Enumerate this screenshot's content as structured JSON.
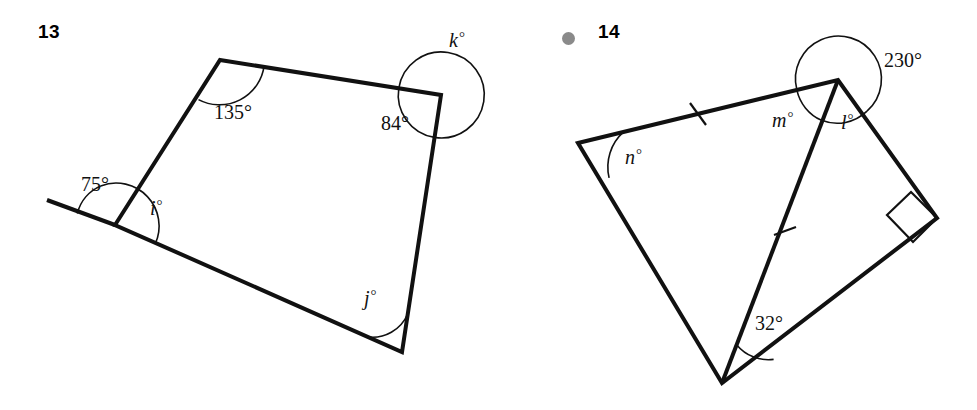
{
  "page": {
    "background": "#ffffff",
    "stroke_color": "#111111",
    "bullet_color": "#8a8a8a"
  },
  "figures": [
    {
      "id": "13",
      "number_label": "13",
      "has_bullet": false,
      "shape": "quadrilateral-with-extended-side",
      "description": "Quadrilateral with one side extended past the lower-left vertex, creating an exterior angle of 75 degrees",
      "vertices": {
        "top_left": [
          220,
          60
        ],
        "top_right": [
          441,
          95
        ],
        "bottom_right": [
          402,
          352
        ],
        "bottom_left": [
          115,
          225
        ],
        "extension_end": [
          47,
          200
        ]
      },
      "angles": [
        {
          "name": "angle-135",
          "label": "135°",
          "value": 135,
          "kind": "interior",
          "at": "top_left"
        },
        {
          "name": "angle-84",
          "label": "84°",
          "value": 84,
          "kind": "interior",
          "at": "top_right"
        },
        {
          "name": "angle-k",
          "label": "k",
          "value": null,
          "kind": "reflex",
          "at": "top_right"
        },
        {
          "name": "angle-j",
          "label": "j",
          "value": null,
          "kind": "interior",
          "at": "bottom_right"
        },
        {
          "name": "angle-i",
          "label": "i",
          "value": null,
          "kind": "interior",
          "at": "bottom_left"
        },
        {
          "name": "angle-75",
          "label": "75°",
          "value": 75,
          "kind": "exterior",
          "at": "bottom_left"
        }
      ],
      "labels": {
        "a135": "135°",
        "a84": "84°",
        "a75": "75°",
        "k": "k",
        "j": "j",
        "i": "i",
        "degree": "°"
      }
    },
    {
      "id": "14",
      "number_label": "14",
      "has_bullet": true,
      "shape": "quadrilateral-with-cevian",
      "description": "Quadrilateral split by a cevian from the top vertex to the bottom vertex; two sides carry single tick marks, one vertex is a right angle, and a reflex angle of 230 degrees is marked at the top vertex",
      "vertices": {
        "left": [
          578,
          143
        ],
        "top": [
          838,
          80
        ],
        "right": [
          937,
          218
        ],
        "bottom": [
          722,
          383
        ]
      },
      "tick_marks": [
        {
          "name": "tick-left-top-side",
          "at": [
            698,
            113
          ]
        },
        {
          "name": "tick-cevian",
          "at": [
            785,
            230
          ]
        }
      ],
      "right_angle_at": "right",
      "angles": [
        {
          "name": "angle-n",
          "label": "n",
          "value": null,
          "kind": "interior",
          "at": "left"
        },
        {
          "name": "angle-m",
          "label": "m",
          "value": null,
          "kind": "interior",
          "at": "top"
        },
        {
          "name": "angle-l",
          "label": "l",
          "value": null,
          "kind": "interior",
          "at": "top"
        },
        {
          "name": "angle-230",
          "label": "230°",
          "value": 230,
          "kind": "reflex",
          "at": "top"
        },
        {
          "name": "angle-32",
          "label": "32°",
          "value": 32,
          "kind": "interior",
          "at": "bottom"
        },
        {
          "name": "angle-right",
          "label": "90°",
          "value": 90,
          "kind": "right-angle",
          "at": "right"
        }
      ],
      "labels": {
        "a230": "230°",
        "a32": "32°",
        "n": "n",
        "m": "m",
        "l": "l",
        "degree": "°"
      }
    }
  ]
}
